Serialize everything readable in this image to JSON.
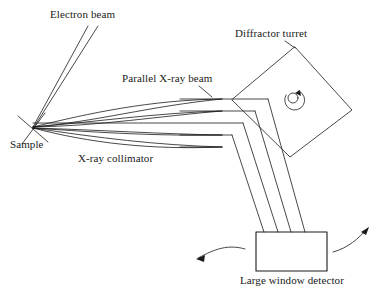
{
  "figure": {
    "type": "schematic-diagram",
    "background_color": "#ffffff",
    "line_color": "#1a1a1a",
    "width": 390,
    "height": 299
  },
  "labels": {
    "electron_beam": "Electron beam",
    "diffractor_turret": "Diffractor turret",
    "parallel_xray_beam": "Parallel X-ray beam",
    "sample": "Sample",
    "xray_collimator": "X-ray collimator",
    "large_window_detector": "Large window detector"
  },
  "components": {
    "sample_point": {
      "x": 32,
      "y": 128
    },
    "turret": {
      "shape": "rotated-square",
      "top": {
        "x": 295,
        "y": 47
      },
      "right": {
        "x": 352,
        "y": 110
      },
      "bottom": {
        "x": 290,
        "y": 157
      },
      "left": {
        "x": 232,
        "y": 100
      },
      "rotation_marker": "rotation-arrow-icon"
    },
    "detector": {
      "shape": "rectangle",
      "x": 256,
      "y": 232,
      "width": 71,
      "height": 39
    }
  },
  "beams": {
    "electron_beam_lines": 2,
    "collimator_curve_count": 4,
    "parallel_beam_count": 5,
    "parallel_beam_y": [
      99,
      111,
      123,
      135,
      147
    ],
    "reflected_beam_count": 4
  },
  "arrows": {
    "detector_left_arrow": "curved-arrow-left",
    "detector_right_arrow": "curved-arrow-right",
    "turret_rotation_arrow": "curved-arrow-rotation"
  }
}
